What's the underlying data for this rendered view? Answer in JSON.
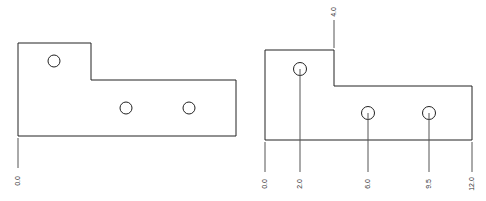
{
  "figures": [
    {
      "name": "plate-undimensioned",
      "labels": [
        "0.0"
      ]
    },
    {
      "name": "plate-ordinate-dimensioned",
      "x_labels": [
        "0.0",
        "2.0",
        "6.0",
        "9.5",
        "12.0"
      ],
      "y_labels": [
        "4.0"
      ]
    }
  ],
  "colors": {
    "line": "#222222",
    "background": "#ffffff"
  }
}
